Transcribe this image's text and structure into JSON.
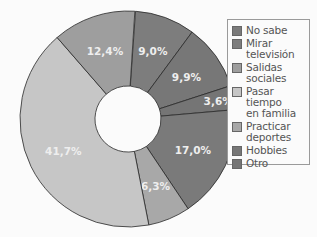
{
  "chart_data": {
    "type": "pie",
    "variant": "donut",
    "title": "",
    "start_angle_deg": 4,
    "slices": [
      {
        "label": "Mirar televisión",
        "value": 9.0,
        "text": "9,0%",
        "color": "#7d7d7d"
      },
      {
        "label": "Hobbies",
        "value": 9.9,
        "text": "9,9%",
        "color": "#777777"
      },
      {
        "label": "Otro",
        "value": 3.6,
        "text": "3,6%",
        "color": "#757575"
      },
      {
        "label": "No sabe",
        "value": 17.0,
        "text": "17,0%",
        "color": "#7a7a7a"
      },
      {
        "label": "Practicar deportes",
        "value": 6.3,
        "text": "6,3%",
        "color": "#a8a8a8"
      },
      {
        "label": "Pasar tiempo en familia",
        "value": 41.7,
        "text": "41,7%",
        "color": "#c6c6c6"
      },
      {
        "label": "Salidas sociales",
        "value": 12.4,
        "text": "12,4%",
        "color": "#9e9e9e"
      }
    ],
    "legend": [
      {
        "label": "No sabe",
        "color": "#7a7a7a"
      },
      {
        "label": "Mirar\ntelevisión",
        "color": "#7d7d7d"
      },
      {
        "label": "Salidas\nsociales",
        "color": "#9e9e9e"
      },
      {
        "label": "Pasar tiempo\nen familia",
        "color": "#c6c6c6"
      },
      {
        "label": "Practicar\ndeportes",
        "color": "#a8a8a8"
      },
      {
        "label": "Hobbies",
        "color": "#777777"
      },
      {
        "label": "Otro",
        "color": "#757575"
      }
    ],
    "legend_position": "right"
  }
}
